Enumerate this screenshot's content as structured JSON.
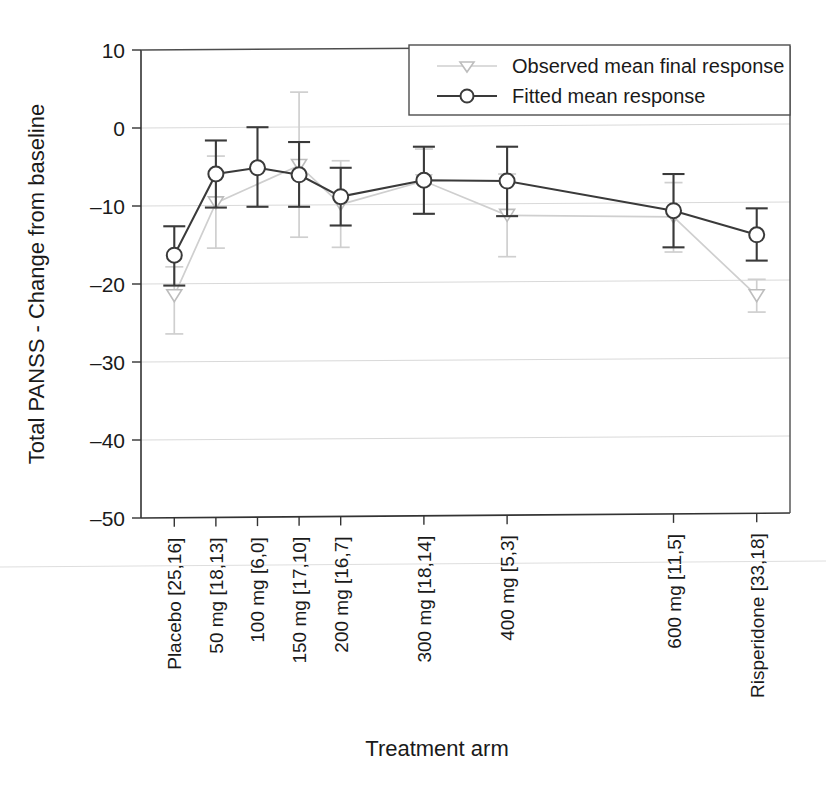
{
  "chart_data": {
    "type": "line",
    "title": "",
    "xlabel": "Treatment arm",
    "ylabel": "Total PANSS - Change from baseline",
    "ylim": [
      -50,
      10
    ],
    "yticks": [
      10,
      0,
      -10,
      -20,
      -30,
      -40,
      -50
    ],
    "yticklabels": [
      "10",
      "0",
      "–10",
      "–20",
      "–30",
      "–40",
      "–50"
    ],
    "grid": true,
    "grid_axis": "y",
    "legend_position": "top-right",
    "categories": [
      "Placebo [25,16]",
      "50 mg [18,13]",
      "100 mg [6,0]",
      "150 mg [17,10]",
      "200 mg [16,7]",
      "300 mg [18,14]",
      "400 mg [5,3]",
      "600 mg [11,5]",
      "Risperidone [33,18]"
    ],
    "x_positions": [
      0,
      50,
      100,
      150,
      200,
      300,
      400,
      600,
      700
    ],
    "xlim": [
      -40,
      740
    ],
    "series": [
      {
        "name": "Observed mean final response",
        "marker": "triangle-down",
        "color": "#cfcfcf",
        "connected": true,
        "values": [
          -21.5,
          -9.6,
          null,
          -4.8,
          -9.8,
          -6.8,
          -11.2,
          -11.4,
          -21.5
        ],
        "err_low": [
          -26.4,
          -15.4,
          null,
          -14.0,
          -15.3,
          -11.0,
          -16.5,
          -15.9,
          -23.6
        ],
        "err_high": [
          -17.8,
          -3.6,
          null,
          4.6,
          -4.2,
          -2.7,
          -5.9,
          -7.0,
          -19.4
        ]
      },
      {
        "name": "Fitted mean response",
        "marker": "circle",
        "color": "#3a3a3a",
        "connected": true,
        "values": [
          -16.3,
          -5.9,
          -5.1,
          -6.0,
          -8.8,
          -6.7,
          -6.8,
          -10.6,
          -13.7
        ],
        "err_low": [
          -20.2,
          -10.2,
          -10.1,
          -10.1,
          -12.5,
          -11.0,
          -11.3,
          -15.3,
          -17.0
        ],
        "err_high": [
          -12.6,
          -1.6,
          0.1,
          -1.8,
          -5.1,
          -2.4,
          -2.4,
          -5.9,
          -10.3
        ]
      }
    ]
  },
  "legend": {
    "entries": [
      {
        "label": "Observed mean final response",
        "marker": "triangle-down-icon",
        "color": "#cfcfcf"
      },
      {
        "label": "Fitted mean response",
        "marker": "circle-icon",
        "color": "#3a3a3a"
      }
    ]
  }
}
